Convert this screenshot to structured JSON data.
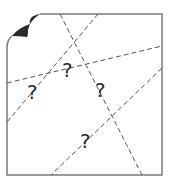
{
  "diagram": {
    "paper": {
      "left": 7,
      "top": 14,
      "right": 162,
      "bottom": 175,
      "stroke": "#7a7a7a",
      "fold_color": "#2a2a2a"
    },
    "crease_lines": [
      {
        "x1": 60,
        "y1": 14,
        "x2": 142,
        "y2": 175
      },
      {
        "x1": 98,
        "y1": 14,
        "x2": 7,
        "y2": 122
      },
      {
        "x1": 7,
        "y1": 83,
        "x2": 162,
        "y2": 46
      },
      {
        "x1": 162,
        "y1": 68,
        "x2": 51,
        "y2": 175
      }
    ],
    "question_marks": [
      {
        "label": "?",
        "x": 62,
        "y": 77
      },
      {
        "label": "?",
        "x": 27,
        "y": 99
      },
      {
        "label": "?",
        "x": 95,
        "y": 97
      },
      {
        "label": "?",
        "x": 80,
        "y": 148
      }
    ]
  }
}
